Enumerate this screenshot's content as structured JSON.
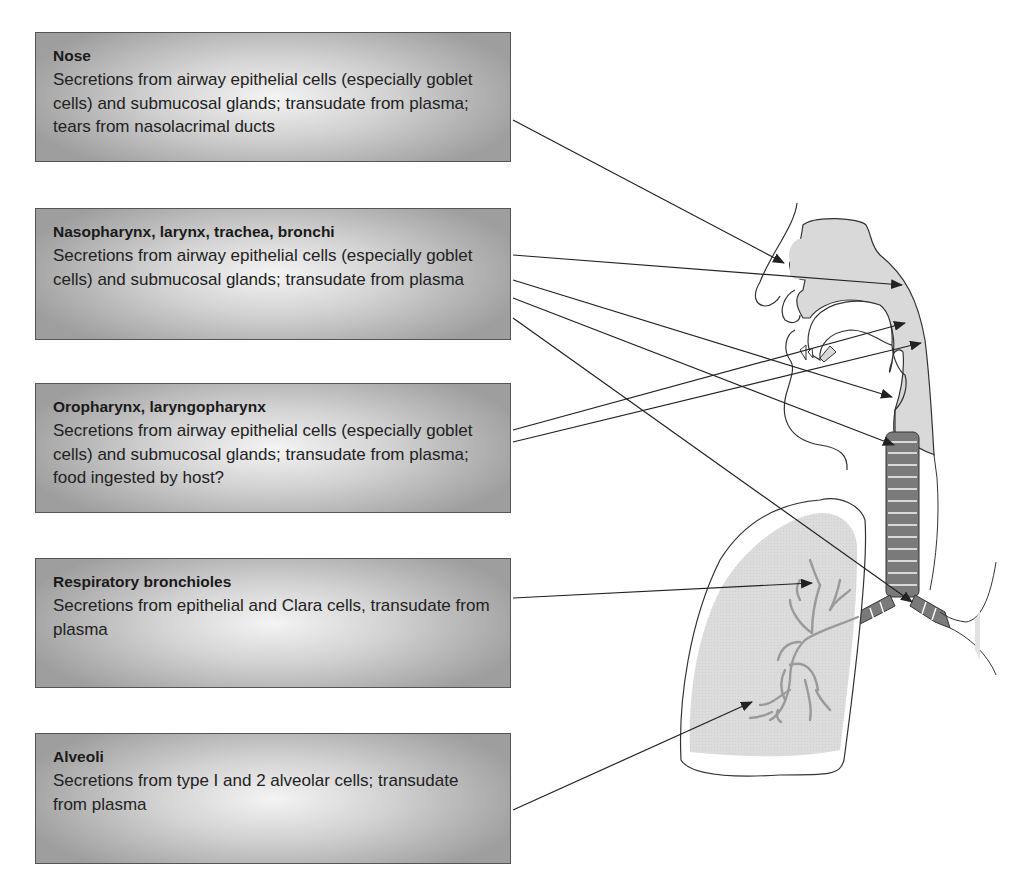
{
  "regions": [
    {
      "title": "Nose",
      "description": "Secretions from airway epithelial cells (especially goblet cells) and submucosal glands; transudate from plasma; tears from nasolacrimal ducts"
    },
    {
      "title": "Nasopharynx, larynx, trachea, bronchi",
      "description": "Secretions from airway epithelial cells (especially goblet cells) and submucosal glands; transudate from plasma"
    },
    {
      "title": "Oropharynx, laryngopharynx",
      "description": "Secretions from airway epithelial cells (especially goblet cells) and submucosal glands; transudate from plasma; food ingested by host?"
    },
    {
      "title": "Respiratory bronchioles",
      "description": "Secretions from epithelial and Clara cells, transudate from plasma"
    },
    {
      "title": "Alveoli",
      "description": "Secretions from type I and 2 alveolar cells; transudate from plasma"
    }
  ],
  "colors": {
    "box_border": "#555555",
    "tissue_fill": "#d9d9d9",
    "trachea_fill": "#7a7a7a",
    "outline": "#333333",
    "arrow": "#222222"
  }
}
